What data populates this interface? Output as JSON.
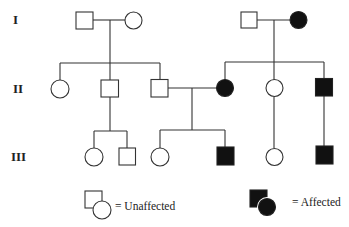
{
  "diagram": {
    "type": "pedigree",
    "generations": [
      {
        "label": "I"
      },
      {
        "label": "II"
      },
      {
        "label": "III"
      }
    ],
    "individuals": {
      "I-1": {
        "sex": "male",
        "affected": false
      },
      "I-2": {
        "sex": "female",
        "affected": false
      },
      "I-3": {
        "sex": "male",
        "affected": false
      },
      "I-4": {
        "sex": "female",
        "affected": true
      },
      "II-1": {
        "sex": "female",
        "affected": false
      },
      "II-2": {
        "sex": "male",
        "affected": false
      },
      "II-3": {
        "sex": "male",
        "affected": false
      },
      "II-4": {
        "sex": "female",
        "affected": true
      },
      "II-5": {
        "sex": "female",
        "affected": false
      },
      "II-6": {
        "sex": "male",
        "affected": true
      },
      "III-1": {
        "sex": "female",
        "affected": false
      },
      "III-2": {
        "sex": "male",
        "affected": false
      },
      "III-3": {
        "sex": "female",
        "affected": false
      },
      "III-4": {
        "sex": "male",
        "affected": true
      },
      "III-5": {
        "sex": "female",
        "affected": false
      },
      "III-6": {
        "sex": "male",
        "affected": true
      }
    },
    "legend": {
      "unaffected_label": "= Unaffected",
      "affected_label": "= Affected"
    },
    "colors": {
      "affected_fill": "#111111",
      "unaffected_fill": "#ffffff",
      "line": "#333333"
    }
  }
}
